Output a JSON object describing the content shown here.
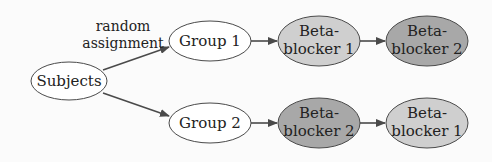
{
  "diagram": {
    "type": "flowchart",
    "colors": {
      "background": "#fbfbfb",
      "white_node": "#ffffff",
      "beta_blocker_1": "#cfcfcf",
      "beta_blocker_2": "#a8a8a8",
      "stroke": "#4a4a4a",
      "text": "#222222"
    },
    "edge_label": {
      "line1": "random",
      "line2": "assignment"
    },
    "nodes": {
      "subjects": {
        "label": "Subjects"
      },
      "group1": {
        "label": "Group 1"
      },
      "group2": {
        "label": "Group 2"
      },
      "g1_first": {
        "line1": "Beta-",
        "line2": "blocker 1"
      },
      "g1_second": {
        "line1": "Beta-",
        "line2": "blocker 2"
      },
      "g2_first": {
        "line1": "Beta-",
        "line2": "blocker 2"
      },
      "g2_second": {
        "line1": "Beta-",
        "line2": "blocker 1"
      }
    },
    "edges": [
      {
        "from": "subjects",
        "to": "group1",
        "label": "random assignment"
      },
      {
        "from": "subjects",
        "to": "group2"
      },
      {
        "from": "group1",
        "to": "g1_first"
      },
      {
        "from": "g1_first",
        "to": "g1_second"
      },
      {
        "from": "group2",
        "to": "g2_first"
      },
      {
        "from": "g2_first",
        "to": "g2_second"
      }
    ]
  }
}
